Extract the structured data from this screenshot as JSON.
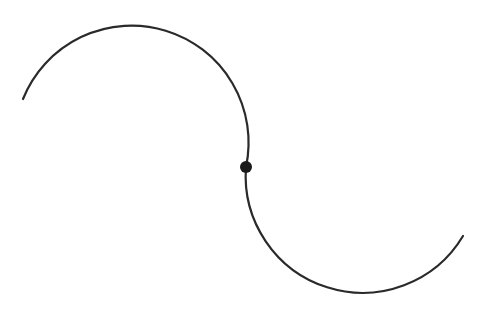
{
  "diagram": {
    "colors": {
      "stroke": "#2a2a2a",
      "background": "#ffffff"
    },
    "arcs": [
      {
        "name": "upper-arc",
        "start": [
          23,
          99
        ],
        "end": [
          246,
          167
        ],
        "radius": 117
      },
      {
        "name": "lower-arc",
        "start": [
          246,
          167
        ],
        "end": [
          463,
          236
        ],
        "radius": 117
      }
    ],
    "junction_point": {
      "x": 246,
      "y": 167,
      "radius": 6
    }
  }
}
